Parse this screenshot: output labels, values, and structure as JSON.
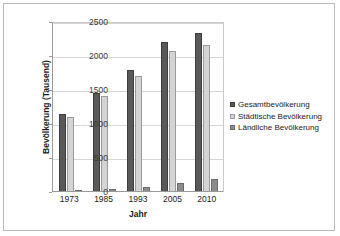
{
  "chart_data": {
    "type": "bar",
    "title": "",
    "subtitle": "",
    "xlabel": "Jahr",
    "ylabel": "Bevölkerung (Tausend)",
    "categories": [
      "1973",
      "1985",
      "1993",
      "2005",
      "2010"
    ],
    "series": [
      {
        "name": "Gesamtbevölkerung",
        "color": "#595959",
        "values": [
          1150,
          1460,
          1790,
          2210,
          2340
        ]
      },
      {
        "name": "Städtische Bevölkerung",
        "color": "#d4d4d4",
        "values": [
          1110,
          1410,
          1710,
          2080,
          2155
        ]
      },
      {
        "name": "Ländliche Bevölkerung",
        "color": "#8c8c8c",
        "values": [
          30,
          40,
          80,
          130,
          190
        ]
      }
    ],
    "ylim": [
      0,
      2500
    ],
    "yticks": [
      0,
      500,
      1000,
      1500,
      2000,
      2500
    ],
    "ytick_labels": [
      "0",
      "500",
      "1000",
      "1500",
      "2000",
      "2500"
    ],
    "grid": true,
    "legend_position": "right",
    "border": true,
    "frame_color": "#b9b9b9",
    "gridline_color": "#d6d6d6",
    "axis_color": "#9a9a9a"
  }
}
